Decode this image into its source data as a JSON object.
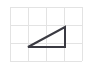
{
  "image": {
    "kind": "geometry-figure",
    "description": "right triangle drawn on a square grid",
    "width": 92,
    "height": 69,
    "background_color": "#ffffff"
  },
  "grid": {
    "name": "square-grid",
    "columns": 4,
    "rows": 3,
    "cell_size": 18,
    "origin_x": 10,
    "origin_y": 7,
    "left": 10,
    "top": 7,
    "right": 82,
    "bottom": 61,
    "line_color": "#e3e3e3",
    "line_width": 1,
    "x_lines": [
      10,
      28,
      46,
      64,
      82
    ],
    "y_lines": [
      7,
      25,
      43,
      61
    ]
  },
  "triangle": {
    "name": "right-triangle",
    "type": "right triangle",
    "stroke_color": "#3a3a42",
    "stroke_width": 2,
    "fill": "none",
    "right_angle_vertex": "bottom-right",
    "base_cells": 2,
    "height_cells": 1,
    "vertices": [
      {
        "label": "bottom-left",
        "grid_x": 1,
        "grid_y": 2,
        "px_x": 28,
        "px_y": 47
      },
      {
        "label": "bottom-right",
        "grid_x": 3,
        "grid_y": 2,
        "px_x": 65,
        "px_y": 47
      },
      {
        "label": "top-right",
        "grid_x": 3,
        "grid_y": 1,
        "px_x": 65,
        "px_y": 27
      }
    ],
    "edges": [
      {
        "name": "base",
        "from": "bottom-left",
        "to": "bottom-right",
        "orientation": "horizontal"
      },
      {
        "name": "vertical-leg",
        "from": "bottom-right",
        "to": "top-right",
        "orientation": "vertical"
      },
      {
        "name": "hypotenuse",
        "from": "top-right",
        "to": "bottom-left",
        "orientation": "diagonal"
      }
    ],
    "points_string": "28,47 65,47 65,27"
  }
}
